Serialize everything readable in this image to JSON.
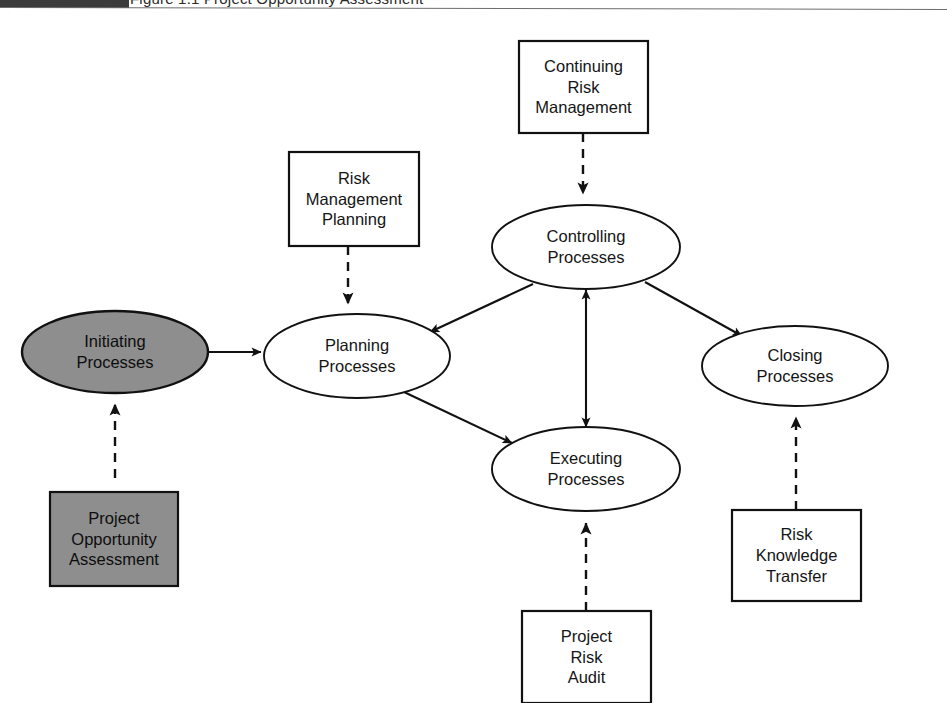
{
  "header": {
    "black_bar": true,
    "running_title": "Figure 1.1   Project Opportunity Assessment"
  },
  "diagram": {
    "colors": {
      "shape_stroke": "#111111",
      "shaded_fill": "#8e8e8e",
      "plain_fill": "#ffffff",
      "arrow_solid": "#111111",
      "arrow_dashed": "#111111"
    },
    "processes": [
      {
        "id": "initiating",
        "label": "Initiating\nProcesses",
        "shape": "ellipse",
        "shaded": true,
        "cx": 115,
        "cy": 338,
        "rx": 93,
        "ry": 41
      },
      {
        "id": "planning",
        "label": "Planning\nProcesses",
        "shape": "ellipse",
        "shaded": false,
        "cx": 357,
        "cy": 342,
        "rx": 93,
        "ry": 42
      },
      {
        "id": "controlling",
        "label": "Controlling\nProcesses",
        "shape": "ellipse",
        "shaded": false,
        "cx": 586,
        "cy": 233,
        "rx": 94,
        "ry": 42
      },
      {
        "id": "executing",
        "label": "Executing\nProcesses",
        "shape": "ellipse",
        "shaded": false,
        "cx": 586,
        "cy": 455,
        "rx": 94,
        "ry": 42
      },
      {
        "id": "closing",
        "label": "Closing\nProcesses",
        "shape": "ellipse",
        "shaded": false,
        "cx": 795,
        "cy": 352,
        "rx": 93,
        "ry": 40
      }
    ],
    "risk_activities": [
      {
        "id": "risk-management-planning",
        "label": "Risk\nManagement\nPlanning",
        "shape": "rect",
        "shaded": false,
        "x": 289,
        "y": 138,
        "w": 130,
        "h": 94
      },
      {
        "id": "continuing-risk-management",
        "label": "Continuing\nRisk\nManagement",
        "shape": "rect",
        "shaded": false,
        "x": 519,
        "y": 27,
        "w": 129,
        "h": 92
      },
      {
        "id": "project-risk-audit",
        "label": "Project\nRisk\nAudit",
        "shape": "rect",
        "shaded": false,
        "x": 522,
        "y": 597,
        "w": 129,
        "h": 92
      },
      {
        "id": "risk-knowledge-transfer",
        "label": "Risk\nKnowledge\nTransfer",
        "shape": "rect",
        "shaded": false,
        "x": 732,
        "y": 496,
        "w": 129,
        "h": 91
      },
      {
        "id": "project-opportunity-assessment",
        "label": "Project\nOpportunity\nAssessment",
        "shape": "rect",
        "shaded": true,
        "x": 50,
        "y": 478,
        "w": 128,
        "h": 94
      }
    ],
    "connections": [
      {
        "id": "initiating-to-planning",
        "from": "initiating",
        "to": "planning",
        "style": "solid",
        "heads": "single"
      },
      {
        "id": "planning-to-executing",
        "from": "planning",
        "to": "executing",
        "style": "solid",
        "heads": "single"
      },
      {
        "id": "controlling-to-planning",
        "from": "controlling",
        "to": "planning",
        "style": "solid",
        "heads": "single"
      },
      {
        "id": "controlling-to-closing",
        "from": "controlling",
        "to": "closing",
        "style": "solid",
        "heads": "single"
      },
      {
        "id": "controlling-executing",
        "from": "controlling",
        "to": "executing",
        "style": "solid",
        "heads": "double"
      },
      {
        "id": "risk-management-planning-to-planning",
        "from": "risk-management-planning",
        "to": "planning",
        "style": "dashed",
        "heads": "single"
      },
      {
        "id": "continuing-risk-management-to-controlling",
        "from": "continuing-risk-management",
        "to": "controlling",
        "style": "dashed",
        "heads": "single"
      },
      {
        "id": "project-risk-audit-to-executing",
        "from": "project-risk-audit",
        "to": "executing",
        "style": "dashed",
        "heads": "single"
      },
      {
        "id": "risk-knowledge-transfer-to-closing",
        "from": "risk-knowledge-transfer",
        "to": "closing",
        "style": "dashed",
        "heads": "single"
      },
      {
        "id": "project-opportunity-assessment-to-initiating",
        "from": "project-opportunity-assessment",
        "to": "initiating",
        "style": "dashed",
        "heads": "single"
      }
    ]
  }
}
